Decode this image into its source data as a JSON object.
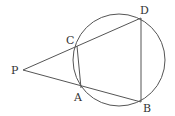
{
  "diagram": {
    "type": "geometry-secants-circle",
    "points": {
      "P": {
        "label": "P",
        "x": 23,
        "y": 70
      },
      "C": {
        "label": "C",
        "x": 77,
        "y": 46
      },
      "A": {
        "label": "A",
        "x": 81,
        "y": 88
      },
      "D": {
        "label": "D",
        "x": 141,
        "y": 18
      },
      "B": {
        "label": "B",
        "x": 141,
        "y": 102
      }
    },
    "circle": {
      "cx": 119,
      "cy": 60,
      "r": 46
    },
    "segments": [
      [
        "P",
        "D"
      ],
      [
        "P",
        "B"
      ],
      [
        "C",
        "A"
      ],
      [
        "D",
        "B"
      ]
    ],
    "colors": {
      "stroke": "#555555",
      "label": "#333333"
    }
  }
}
